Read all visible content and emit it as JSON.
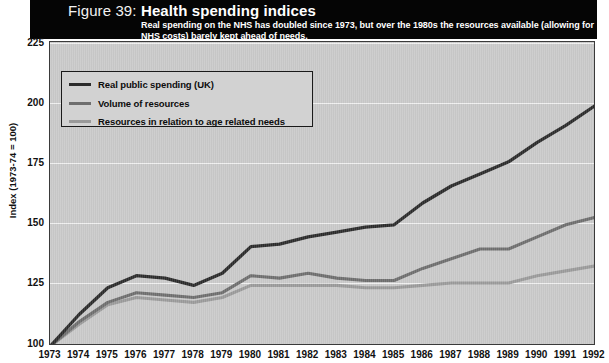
{
  "figure": {
    "number": "Figure 39:",
    "title": "Health spending indices",
    "subtitle": "Real spending on the NHS has doubled since 1973, but over the 1980s the resources available (allowing for NHS costs) barely kept ahead of needs."
  },
  "colors": {
    "series_dark": "#2b2b2b",
    "series_mid": "#6e6e6e",
    "series_light": "#9a9a9a",
    "plot_background": "#c9c9c9",
    "header_background": "#050505",
    "gridline": "#f0f0f0"
  },
  "chart_data": {
    "type": "line",
    "title": "Health spending indices",
    "subtitle": "Real spending on the NHS has doubled since 1973, but over the 1980s the resources available (allowing for NHS costs) barely kept ahead of needs.",
    "xlabel": "",
    "ylabel": "Index (1973-74 = 100)",
    "ylim": [
      100,
      225
    ],
    "yticks": [
      100,
      125,
      150,
      175,
      200,
      225
    ],
    "grid": true,
    "legend_position": "upper-left",
    "categories": [
      1973,
      1974,
      1975,
      1976,
      1977,
      1978,
      1979,
      1980,
      1981,
      1982,
      1983,
      1984,
      1985,
      1986,
      1987,
      1988,
      1989,
      1990,
      1991,
      1992
    ],
    "series": [
      {
        "name": "Real public spending (UK)",
        "color": "#2b2b2b",
        "values": [
          100,
          113,
          124,
          129,
          128,
          125,
          130,
          141,
          142,
          145,
          147,
          149,
          150,
          159,
          166,
          171,
          176,
          184,
          191,
          199
        ]
      },
      {
        "name": "Volume of resources",
        "color": "#6e6e6e",
        "values": [
          100,
          110,
          118,
          122,
          121,
          120,
          122,
          129,
          128,
          130,
          128,
          127,
          127,
          132,
          136,
          140,
          140,
          145,
          150,
          153
        ]
      },
      {
        "name": "Resources in relation to age related needs",
        "color": "#9a9a9a",
        "values": [
          100,
          109,
          117,
          120,
          119,
          118,
          120,
          125,
          125,
          125,
          125,
          124,
          124,
          125,
          126,
          126,
          126,
          129,
          131,
          133
        ]
      }
    ]
  },
  "axes": {
    "y_ticks": [
      "225",
      "200",
      "175",
      "150",
      "125",
      "100"
    ],
    "y_title": "Index (1973-74 = 100)",
    "x_ticks": [
      "1973",
      "1974",
      "1975",
      "1976",
      "1977",
      "1978",
      "1979",
      "1980",
      "1981",
      "1982",
      "1983",
      "1984",
      "1985",
      "1986",
      "1987",
      "1988",
      "1989",
      "1990",
      "1991",
      "1992"
    ]
  },
  "legend": {
    "items": [
      {
        "label": "Real public spending (UK)"
      },
      {
        "label": "Volume of resources"
      },
      {
        "label": "Resources in relation to age related needs"
      }
    ]
  }
}
